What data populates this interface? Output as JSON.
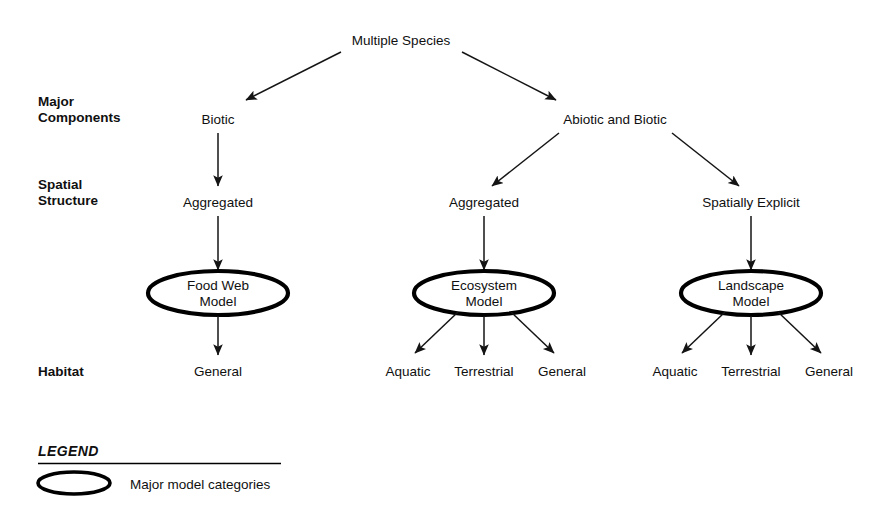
{
  "diagram": {
    "title_node": "Multiple Species",
    "row_labels": [
      {
        "id": "major-components",
        "line1": "Major",
        "line2": "Components"
      },
      {
        "id": "spatial-structure",
        "line1": "Spatial",
        "line2": "Structure"
      },
      {
        "id": "habitat",
        "line1": "Habitat",
        "line2": ""
      }
    ],
    "components": [
      {
        "id": "biotic",
        "label": "Biotic"
      },
      {
        "id": "abiotic-and-biotic",
        "label": "Abiotic and Biotic"
      }
    ],
    "spatial_structures": [
      {
        "id": "aggregated-left",
        "label": "Aggregated"
      },
      {
        "id": "aggregated-middle",
        "label": "Aggregated"
      },
      {
        "id": "spatially-explicit",
        "label": "Spatially Explicit"
      }
    ],
    "models": [
      {
        "id": "food-web-model",
        "line1": "Food Web",
        "line2": "Model"
      },
      {
        "id": "ecosystem-model",
        "line1": "Ecosystem",
        "line2": "Model"
      },
      {
        "id": "landscape-model",
        "line1": "Landscape",
        "line2": "Model"
      }
    ],
    "habitats": [
      {
        "id": "food-web-general",
        "label": "General"
      },
      {
        "id": "ecosystem-aquatic",
        "label": "Aquatic"
      },
      {
        "id": "ecosystem-terrestrial",
        "label": "Terrestrial"
      },
      {
        "id": "ecosystem-general",
        "label": "General"
      },
      {
        "id": "landscape-aquatic",
        "label": "Aquatic"
      },
      {
        "id": "landscape-terrestrial",
        "label": "Terrestrial"
      },
      {
        "id": "landscape-general",
        "label": "General"
      }
    ]
  },
  "legend": {
    "title": "LEGEND",
    "entries": [
      {
        "id": "major-model-categories",
        "symbol": "ellipse",
        "label": "Major model categories"
      }
    ]
  },
  "colors": {
    "text": "#101010",
    "stroke": "#000000",
    "background": "#ffffff"
  }
}
